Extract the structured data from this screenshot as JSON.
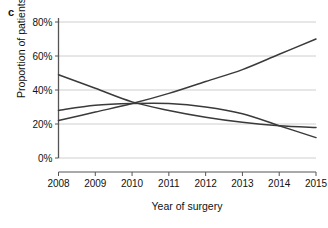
{
  "panel": {
    "label": "c"
  },
  "chart_data": {
    "type": "line",
    "title": "",
    "subtitle": "",
    "xlabel": "Year of surgery",
    "ylabel": "Proportion of patients",
    "x": [
      2008,
      2009,
      2010,
      2011,
      2012,
      2013,
      2014,
      2015
    ],
    "xtick_labels": [
      "2008",
      "2009",
      "2010",
      "2011",
      "2012",
      "2013",
      "2014",
      "2015"
    ],
    "ytick_labels": [
      "0%",
      "20%",
      "40%",
      "60%",
      "80%"
    ],
    "ytick_values": [
      0,
      20,
      40,
      60,
      80
    ],
    "xlim": [
      2008,
      2015
    ],
    "ylim": [
      0,
      80
    ],
    "grid": "horizontal",
    "legend": "none",
    "line_color": "#3a3a3a",
    "grid_color": "#c8c8c8",
    "axis_color": "#555555",
    "series": [
      {
        "name": "rising",
        "values": [
          22,
          27,
          32,
          38,
          45,
          52,
          61,
          70
        ],
        "color": "#3a3a3a"
      },
      {
        "name": "declining",
        "values": [
          49,
          41,
          33,
          28,
          24,
          21,
          19,
          18
        ],
        "color": "#3a3a3a"
      },
      {
        "name": "flat-then-declining",
        "values": [
          28,
          31,
          32,
          32,
          30,
          26,
          19,
          12
        ],
        "color": "#3a3a3a"
      }
    ]
  }
}
